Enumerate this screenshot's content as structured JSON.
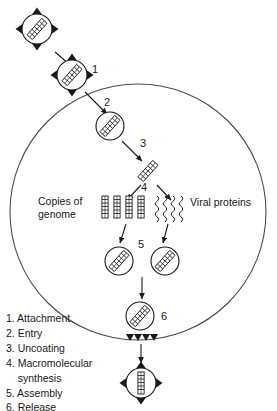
{
  "figure": {
    "type": "diagram",
    "ink_color": "#1a1a1a",
    "background": "#ffffff"
  },
  "cell": {
    "name": "host-cell-membrane",
    "shape": "circle"
  },
  "step_numbers": [
    {
      "id": "1",
      "label": "1"
    },
    {
      "id": "2",
      "label": "2"
    },
    {
      "id": "3",
      "label": "3"
    },
    {
      "id": "4",
      "label": "4"
    },
    {
      "id": "5",
      "label": "5"
    },
    {
      "id": "6",
      "label": "6"
    }
  ],
  "side_labels": {
    "genome_copies_line1": "Copies of",
    "genome_copies_line2": "genome",
    "viral_proteins": "Viral proteins"
  },
  "legend": {
    "items": [
      "1. Attachment",
      "2. Entry",
      "3. Uncoating",
      "4. Macromolecular",
      "    synthesis",
      "5. Assembly",
      "6. Release"
    ]
  },
  "elements": {
    "virion_extracellular": "enveloped-virion-with-spikes",
    "virion_attached": "virion-attached-to-membrane",
    "endosome": "endosome-vesicle-with-genome",
    "naked_genome": "uncoated-genome",
    "genome_copies_count": 4,
    "viral_protein_squiggles_count": 4,
    "assembled_particles_count": 2,
    "budding_spikes_count": 4,
    "released_virion": "released-enveloped-virion"
  }
}
